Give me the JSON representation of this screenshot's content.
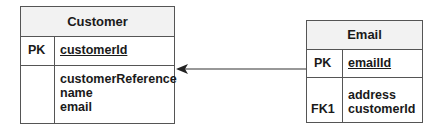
{
  "entities": {
    "customer": {
      "title": "Customer",
      "pk_label": "PK",
      "pk_field": "customerId",
      "attributes": [
        "customerReference",
        "name",
        "email"
      ]
    },
    "email": {
      "title": "Email",
      "pk_label": "PK",
      "pk_field": "emailId",
      "attributes": [
        "address",
        "customerId"
      ],
      "fk_label": "FK1"
    }
  },
  "relationship": {
    "from": "Email.customerId",
    "to": "Customer",
    "line_color": "#333333"
  }
}
